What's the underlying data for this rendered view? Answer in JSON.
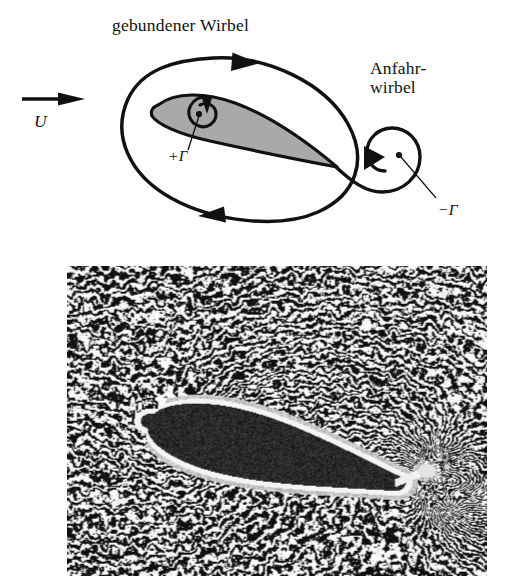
{
  "figure": {
    "domain_kind": "technical-diagram-with-photograph",
    "background_color": "#ffffff",
    "width": 511,
    "height": 581
  },
  "diagram": {
    "title_label": "gebundener Wirbel",
    "starting_vortex_label": "Anfahr-\nwirbel",
    "freestream_label": "U",
    "bound_circulation_label": "+Γ",
    "shed_circulation_label": "−Γ",
    "airfoil_fill_color": "#a9a9a9",
    "stroke_color": "#111111",
    "circuit_description": "closed clockwise material circuit enclosing the airfoil",
    "arrow_directions": {
      "freestream": "right",
      "circuit_top": "right",
      "circuit_bottom": "left",
      "bound_vortex_spiral": "counterclockwise",
      "starting_vortex_spiral": "clockwise"
    }
  },
  "photograph": {
    "caption_text": "",
    "description": "flow visualization of airfoil with starting vortex",
    "frame": {
      "x": 67,
      "y": 266,
      "width": 420,
      "height": 310
    },
    "airfoil": {
      "nose_x": 0.2,
      "nose_y": 0.5,
      "tail_x": 0.78,
      "tail_y": 0.7,
      "thickness": 0.085
    },
    "vortex_center": {
      "x": 0.855,
      "y": 0.66
    },
    "texture": {
      "cell_size": 3.3,
      "contrast": 0.92,
      "seed": 20240517
    }
  }
}
